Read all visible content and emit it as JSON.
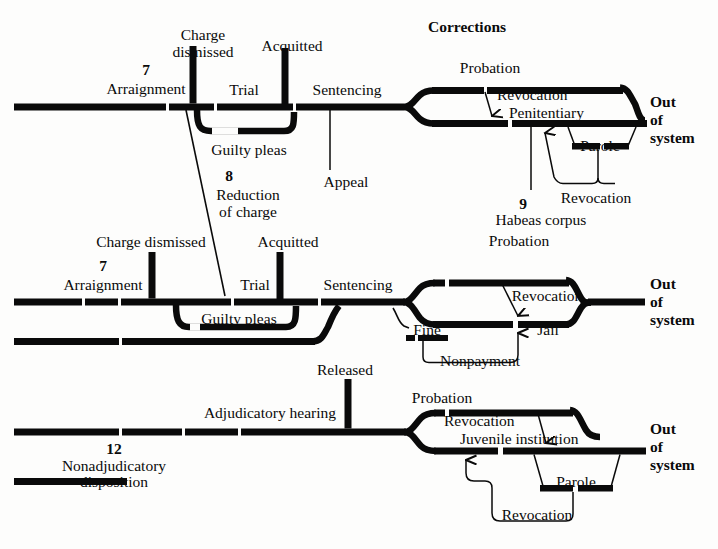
{
  "diagram": {
    "title": "Corrections"
  },
  "rows": {
    "felony": {
      "stages": [
        "Arraignment",
        "Trial",
        "Sentencing"
      ],
      "numbers": [
        {
          "value": "7",
          "label": "Arraignment"
        },
        {
          "value": "8",
          "label": "Reduction of charge"
        },
        {
          "value": "9",
          "label": "Habeas corpus"
        }
      ],
      "exits": [
        "Charge dismissed",
        "Acquitted",
        "Appeal"
      ],
      "branches": [
        "Guilty pleas",
        "Reduction of charge"
      ],
      "corrections": [
        "Probation",
        "Revocation",
        "Penitentiary",
        "Parole",
        "Revocation"
      ],
      "outcome": [
        "Out",
        "of",
        "system"
      ]
    },
    "misdemeanor": {
      "stages": [
        "Arraignment",
        "Trial",
        "Sentencing"
      ],
      "numbers": [
        {
          "value": "7",
          "label": "Arraignment"
        }
      ],
      "exits": [
        "Charge dismissed",
        "Acquitted"
      ],
      "branches": [
        "Guilty pleas"
      ],
      "corrections": [
        "Probation",
        "Revocation",
        "Fine",
        "Nonpayment",
        "Jail"
      ],
      "outcome": [
        "Out",
        "of",
        "system"
      ]
    },
    "juvenile": {
      "stages": [
        "Adjudicatory hearing"
      ],
      "numbers": [
        {
          "value": "12",
          "label": "Nonadjudicatory disposition"
        }
      ],
      "exits": [
        "Released"
      ],
      "corrections": [
        "Probation",
        "Revocation",
        "Juvenile institution",
        "Parole",
        "Revocation"
      ],
      "outcome": [
        "Out",
        "of",
        "system"
      ]
    }
  },
  "labels": {
    "corrections_title": "Corrections",
    "charge_dismissed_1": "Charge",
    "charge_dismissed_2": "dismissed",
    "acquitted": "Acquitted",
    "num_7a": "7",
    "arraignment_a": "Arraignment",
    "trial_a": "Trial",
    "sentencing_a": "Sentencing",
    "guilty_pleas_a": "Guilty pleas",
    "appeal": "Appeal",
    "num_8": "8",
    "reduction_1": "Reduction",
    "reduction_2": "of charge",
    "probation_a": "Probation",
    "revocation_a": "Revocation",
    "penitentiary": "Penitentiary",
    "parole_a": "Parole",
    "revocation_a2": "Revocation",
    "num_9": "9",
    "habeas_corpus": "Habeas corpus",
    "out_a1": "Out",
    "out_a2": "of",
    "out_a3": "system",
    "charge_dismissed_b": "Charge dismissed",
    "acquitted_b": "Acquitted",
    "num_7b": "7",
    "arraignment_b": "Arraignment",
    "trial_b": "Trial",
    "sentencing_b": "Sentencing",
    "guilty_pleas_b": "Guilty pleas",
    "probation_b": "Probation",
    "revocation_b": "Revocation",
    "fine": "Fine",
    "nonpayment": "Nonpayment",
    "jail": "Jail",
    "out_b1": "Out",
    "out_b2": "of",
    "out_b3": "system",
    "released": "Released",
    "adjudicatory_hearing": "Adjudicatory hearing",
    "num_12": "12",
    "nonadjudicatory_1": "Nonadjudicatory",
    "nonadjudicatory_2": "disposition",
    "probation_c": "Probation",
    "revocation_c": "Revocation",
    "juvenile_institution": "Juvenile institution",
    "parole_c": "Parole",
    "revocation_c2": "Revocation",
    "out_c1": "Out",
    "out_c2": "of",
    "out_c3": "system"
  },
  "colors": {
    "ink": "#0a0a0a",
    "background": "#fdfdfc"
  }
}
